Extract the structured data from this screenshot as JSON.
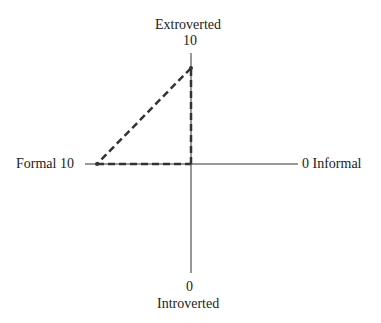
{
  "diagram": {
    "axes": {
      "top": {
        "label": "Extroverted",
        "value": "10"
      },
      "bottom": {
        "label": "Introverted",
        "value": "0"
      },
      "left": {
        "label": "Formal",
        "value": "10",
        "text": "Formal 10"
      },
      "right": {
        "label": "Informal",
        "value": "0",
        "text": "0 Informal"
      }
    },
    "triangle": {
      "vertices": [
        {
          "name": "formal-10",
          "x_axis": 10,
          "y_axis": 5
        },
        {
          "name": "origin",
          "x_axis": 5,
          "y_axis": 5
        },
        {
          "name": "extroverted-high",
          "x_axis": 5,
          "y_axis": 9
        }
      ],
      "style": "dashed",
      "color": "#333333"
    }
  }
}
